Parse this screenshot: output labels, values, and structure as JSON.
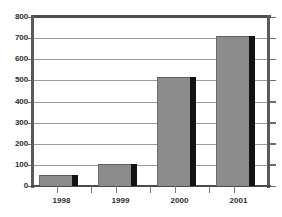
{
  "chart_data": {
    "type": "bar",
    "title": "",
    "xlabel": "",
    "ylabel": "",
    "categories": [
      "1998",
      "1999",
      "2000",
      "2001"
    ],
    "values": [
      50,
      105,
      515,
      710
    ],
    "ylim": [
      0,
      800
    ],
    "ytick_labels": [
      "800",
      "700",
      "600",
      "500",
      "400",
      "300",
      "200",
      "100",
      "0"
    ],
    "ytick_values": [
      800,
      700,
      600,
      500,
      400,
      300,
      200,
      100,
      0
    ],
    "ytick_step": 100,
    "grid": "horizontal",
    "legend": "none",
    "series": [
      {
        "name": "",
        "values": [
          50,
          105,
          515,
          710
        ]
      }
    ],
    "bar_style": {
      "fill_color": "#8c8c8c",
      "shadow_color": "#121212",
      "border_color": "#5e5e5e",
      "three_d": true
    },
    "axis_style": {
      "frame_color": "#4d4d4d",
      "gridline_color": "#9b9b9b",
      "tick_color": "#6e6e6e",
      "label_color": "#2e2e2e",
      "background_color": "#ffffff"
    }
  },
  "clipped_title": "",
  "axis": {
    "y_labels": [
      {
        "text": "800",
        "value": 800
      },
      {
        "text": "700",
        "value": 700
      },
      {
        "text": "600",
        "value": 600
      },
      {
        "text": "500",
        "value": 500
      },
      {
        "text": "400",
        "value": 400
      },
      {
        "text": "300",
        "value": 300
      },
      {
        "text": "200",
        "value": 200
      },
      {
        "text": "100",
        "value": 100
      },
      {
        "text": "0",
        "value": 0
      }
    ],
    "x_labels": [
      {
        "text": "1998"
      },
      {
        "text": "1999"
      },
      {
        "text": "2000"
      },
      {
        "text": "2001"
      }
    ]
  },
  "bars": [
    {
      "label": "1998",
      "value": 50
    },
    {
      "label": "1999",
      "value": 105
    },
    {
      "label": "2000",
      "value": 515
    },
    {
      "label": "2001",
      "value": 710
    }
  ]
}
